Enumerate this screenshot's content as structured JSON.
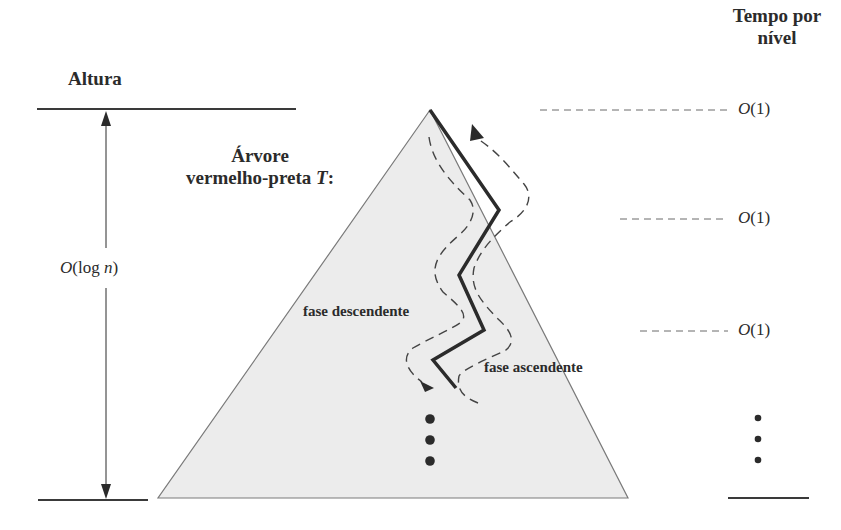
{
  "left_axis": {
    "header": "Altura",
    "height_label_prefix": "O",
    "height_label_arg": "(log ",
    "height_label_var": "n",
    "height_label_suffix": ")"
  },
  "right_axis": {
    "header_line1": "Tempo por",
    "header_line2": "nível",
    "levels": [
      {
        "prefix": "O",
        "arg": "(1)"
      },
      {
        "prefix": "O",
        "arg": "(1)"
      },
      {
        "prefix": "O",
        "arg": "(1)"
      }
    ]
  },
  "tree": {
    "title_line1": "Árvore",
    "title_line2_text": "vermelho-preta ",
    "title_line2_var": "T",
    "title_line2_suffix": ":",
    "fill_color": "#ececec",
    "edge_color": "#7a7a7a"
  },
  "phases": {
    "descending": "fase descendente",
    "ascending": "fase ascendente"
  },
  "colors": {
    "ink": "#2b2b2b",
    "dash": "#555555"
  }
}
